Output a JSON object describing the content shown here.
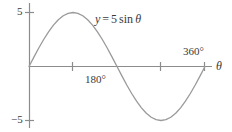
{
  "chart_data": {
    "type": "line",
    "title": "",
    "equation_label": "y = 5 sin θ",
    "equation_parts": {
      "lhs": "y",
      "equals": "=",
      "amplitude": "5",
      "function": "sin",
      "variable": "θ"
    },
    "xlabel": "θ",
    "ylabel": "",
    "xlim": [
      0,
      390
    ],
    "ylim": [
      -6.6,
      6.6
    ],
    "grid": false,
    "legend": null,
    "x_unit": "degrees",
    "x_tick_labels": [
      "180°",
      "360°"
    ],
    "x_tick_values": [
      180,
      360
    ],
    "x_tick_marks": [
      90,
      270,
      360
    ],
    "y_tick_labels": [
      "5",
      "−5"
    ],
    "y_tick_values": [
      5,
      -5
    ],
    "series": [
      {
        "name": "y = 5 sin θ",
        "color": "#9a9a9a",
        "x": [
          0,
          10,
          20,
          30,
          40,
          50,
          60,
          70,
          80,
          90,
          100,
          110,
          120,
          130,
          140,
          150,
          160,
          170,
          180,
          190,
          200,
          210,
          220,
          230,
          240,
          250,
          260,
          270,
          280,
          290,
          300,
          310,
          320,
          330,
          340,
          350,
          360
        ],
        "y": [
          0,
          0.87,
          1.71,
          2.5,
          3.21,
          3.83,
          4.33,
          4.7,
          4.92,
          5,
          4.92,
          4.7,
          4.33,
          3.83,
          3.21,
          2.5,
          1.71,
          0.87,
          0,
          -0.87,
          -1.71,
          -2.5,
          -3.21,
          -3.83,
          -4.33,
          -4.7,
          -4.92,
          -5,
          -4.92,
          -4.7,
          -4.33,
          -3.83,
          -3.21,
          -2.5,
          -1.71,
          -0.87,
          0
        ]
      }
    ],
    "annotations": [
      {
        "text": "y = 5 sin θ",
        "x": 150,
        "y": 5.8
      },
      {
        "text": "180°",
        "x": 180,
        "y": -0.9
      },
      {
        "text": "360°",
        "x": 352,
        "y": 1.5
      }
    ],
    "axis_color": "#8c8c8c",
    "text_color": "#3a3a3a"
  }
}
